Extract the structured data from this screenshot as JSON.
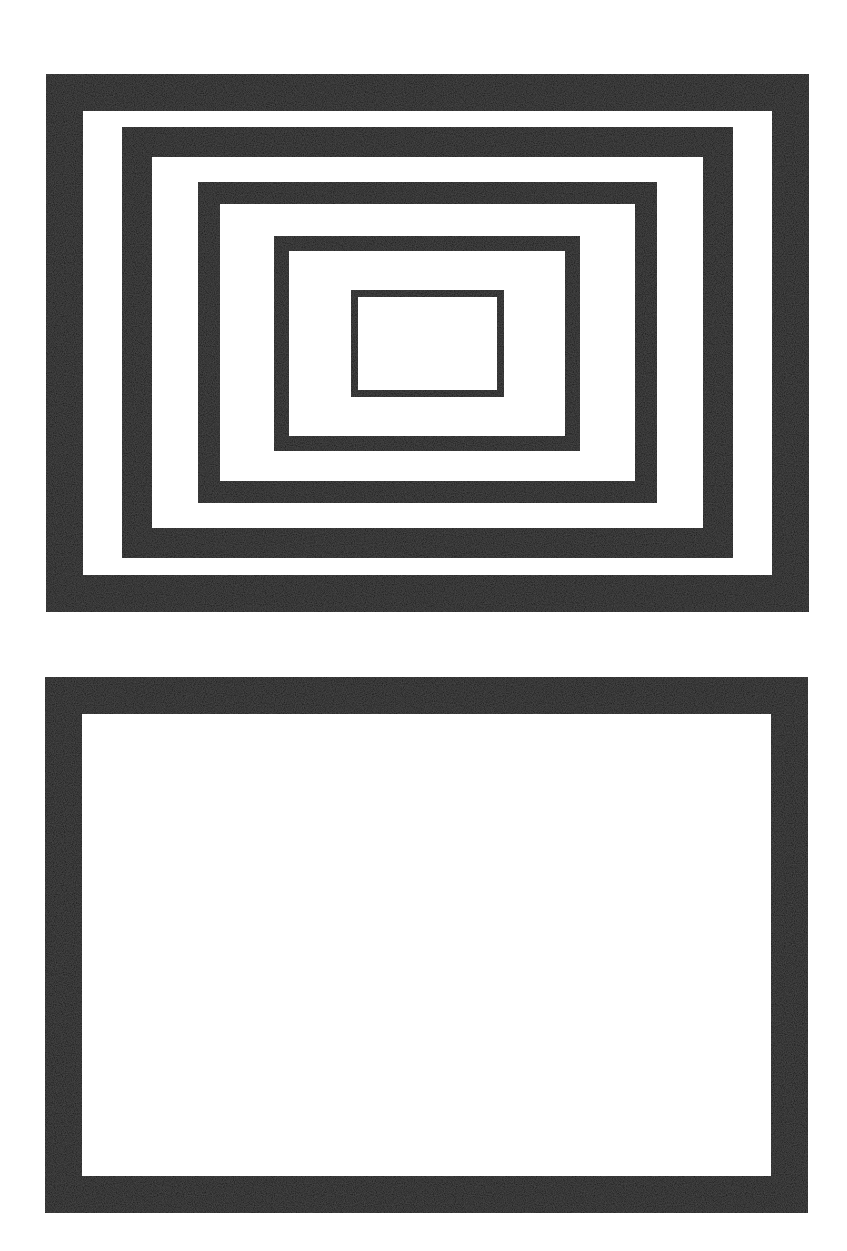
{
  "figure": {
    "colors": {
      "frame": "#1c1c1c",
      "background": "#ffffff"
    },
    "panels": [
      {
        "name": "nested-frames-panel",
        "frame_count": 5
      },
      {
        "name": "single-frame-panel",
        "frame_count": 1
      }
    ]
  }
}
